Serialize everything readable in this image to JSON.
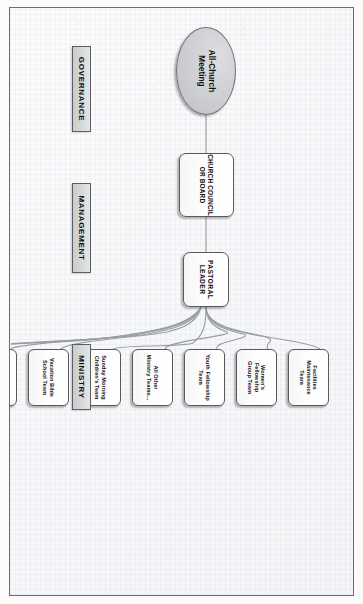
{
  "document": {
    "title": "Church Organizational Chart",
    "orientation": "landscape-rotated-90-clockwise",
    "smudges": [
      "~ ~ ~",
      "~ ~ ~",
      "~"
    ]
  },
  "chart_data": {
    "type": "diagram",
    "diagram_type": "organizational-hierarchy",
    "lanes": [
      {
        "id": "governance",
        "label": "GOVERNANCE"
      },
      {
        "id": "management",
        "label": "MANAGEMENT"
      },
      {
        "id": "ministry",
        "label": "MINISTRY"
      }
    ],
    "nodes": [
      {
        "id": "all-church-meeting",
        "label": "All-Church\nMeeting",
        "shape": "ellipse",
        "fill": "#cdced1",
        "lane": "governance"
      },
      {
        "id": "church-council",
        "label": "CHURCH COUNCIL\nOR BOARD",
        "shape": "rounded-rect",
        "fill": "#ffffff",
        "lane": "management"
      },
      {
        "id": "pastoral-leader",
        "label": "PASTORAL\nLEADER",
        "shape": "rounded-rect",
        "fill": "#ffffff",
        "lane": "management"
      }
    ],
    "ministry_teams": [
      {
        "id": "food-bank",
        "line1": "Food Bank",
        "line2": "Team"
      },
      {
        "id": "mission-trip",
        "line1": "Mission Trip",
        "line2": "Team"
      },
      {
        "id": "first-service-worship",
        "line1": "1st Service",
        "line2": "Worship Team"
      },
      {
        "id": "second-service-worship",
        "line1": "2nd Service",
        "line2": "Worship Team"
      },
      {
        "id": "vacation-bible-school",
        "line1": "Vacation Bible",
        "line2": "School Team"
      },
      {
        "id": "sunday-morning-childrens",
        "line1": "Sunday Morning",
        "line2": "Children's Team"
      },
      {
        "id": "all-other-ministry-teams",
        "line1": "All Other",
        "line2": "Ministry Teams..."
      },
      {
        "id": "youth-fellowship",
        "line1": "Youth Fellowship",
        "line2": "Team"
      },
      {
        "id": "womens-fellowship-group",
        "line1": "Women's Fellowship",
        "line2": "Group Team"
      },
      {
        "id": "facilities-maintenance",
        "line1": "Facilities Maintenance",
        "line2": "Team"
      }
    ],
    "edges": [
      {
        "from": "all-church-meeting",
        "to": "church-council"
      },
      {
        "from": "church-council",
        "to": "pastoral-leader"
      },
      {
        "from": "pastoral-leader",
        "to": "food-bank"
      },
      {
        "from": "pastoral-leader",
        "to": "mission-trip"
      },
      {
        "from": "pastoral-leader",
        "to": "first-service-worship"
      },
      {
        "from": "pastoral-leader",
        "to": "second-service-worship"
      },
      {
        "from": "pastoral-leader",
        "to": "vacation-bible-school"
      },
      {
        "from": "pastoral-leader",
        "to": "sunday-morning-childrens"
      },
      {
        "from": "pastoral-leader",
        "to": "all-other-ministry-teams"
      },
      {
        "from": "pastoral-leader",
        "to": "youth-fellowship"
      },
      {
        "from": "pastoral-leader",
        "to": "womens-fellowship-group"
      },
      {
        "from": "pastoral-leader",
        "to": "facilities-maintenance"
      }
    ],
    "colors": {
      "node_border": "#58595b",
      "node_fill": "#ffffff",
      "root_fill": "#cdced1",
      "lane_fill": "#d7d8da",
      "connector": "#9a9da3",
      "page_border": "#6d6d6d",
      "page_bg": "#f7f8f9"
    }
  }
}
